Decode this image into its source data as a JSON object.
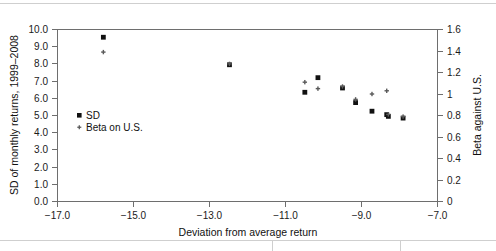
{
  "chart_data": {
    "type": "scatter",
    "title": "",
    "xlabel": "Deviation from average return",
    "ylabel": "SD of monthly returns, 1999–2008",
    "y2label": "Beta against U.S.",
    "xlim": [
      -17.8,
      -6.2
    ],
    "ylim": [
      0.0,
      10.0
    ],
    "y2lim": [
      0.0,
      1.6
    ],
    "grid": false,
    "legend_position": "inside-left",
    "xticks": [
      "−17.0",
      "−15.0",
      "−13.0",
      "−11.0",
      "−9.0",
      "−7.0"
    ],
    "xtick_values": [
      -17.0,
      -15.0,
      -13.0,
      -11.0,
      -9.0,
      -7.0
    ],
    "yticks": [
      "0.0",
      "1.0",
      "2.0",
      "3.0",
      "4.0",
      "5.0",
      "6.0",
      "7.0",
      "8.0",
      "9.0",
      "10.0"
    ],
    "ytick_values": [
      0.0,
      1.0,
      2.0,
      3.0,
      4.0,
      5.0,
      6.0,
      7.0,
      8.0,
      9.0,
      10.0
    ],
    "y2ticks": [
      "0",
      "0.2",
      "0.4",
      "0.6",
      "0.8",
      "1",
      "1.2",
      "1.4",
      "1.6"
    ],
    "y2tick_values": [
      0.0,
      0.2,
      0.4,
      0.6,
      0.8,
      1.0,
      1.2,
      1.4,
      1.6
    ],
    "series": [
      {
        "name": "SD",
        "marker": "square",
        "color": "#111111",
        "axis": "left",
        "points": [
          {
            "x": -16.4,
            "y": 9.55
          },
          {
            "x": -12.55,
            "y": 7.95
          },
          {
            "x": -10.25,
            "y": 6.35
          },
          {
            "x": -9.85,
            "y": 7.2
          },
          {
            "x": -9.1,
            "y": 6.6
          },
          {
            "x": -8.7,
            "y": 5.75
          },
          {
            "x": -8.2,
            "y": 5.25
          },
          {
            "x": -7.75,
            "y": 5.05
          },
          {
            "x": -7.7,
            "y": 4.95
          },
          {
            "x": -7.25,
            "y": 4.85
          }
        ]
      },
      {
        "name": "Beta on U.S.",
        "marker": "cross",
        "color": "#5a5a5a",
        "axis": "right",
        "points": [
          {
            "x": -16.4,
            "y": 1.39
          },
          {
            "x": -12.55,
            "y": 1.28
          },
          {
            "x": -10.25,
            "y": 1.11
          },
          {
            "x": -9.85,
            "y": 1.05
          },
          {
            "x": -9.1,
            "y": 1.07
          },
          {
            "x": -8.7,
            "y": 0.95
          },
          {
            "x": -8.2,
            "y": 1.0
          },
          {
            "x": -7.75,
            "y": 1.03
          },
          {
            "x": -7.7,
            "y": 0.81
          },
          {
            "x": -7.25,
            "y": 0.79
          }
        ]
      }
    ],
    "legend": [
      {
        "label": "SD",
        "marker": "square"
      },
      {
        "label": "Beta on U.S.",
        "marker": "cross"
      }
    ]
  }
}
